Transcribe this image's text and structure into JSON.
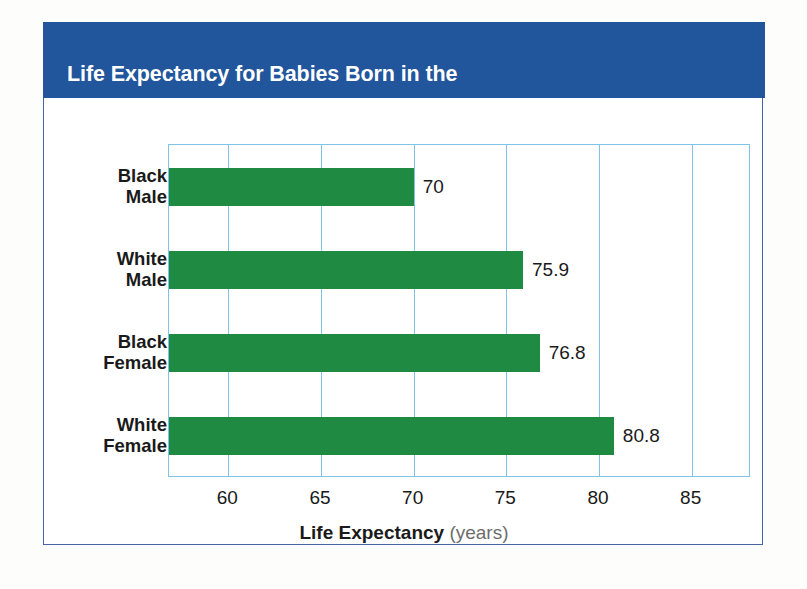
{
  "figure": {
    "title_line1": "Life Expectancy for Babies Born in the",
    "title_line2": "United States, 2007",
    "title_superscript": "32",
    "header_color": "#21559C",
    "bar_color": "#1F8A42",
    "grid_color": "#7FC4E8",
    "border_color": "#4A63A8"
  },
  "chart_data": {
    "type": "bar",
    "orientation": "horizontal",
    "title": "Life Expectancy for Babies Born in the United States, 2007",
    "categories": [
      "Black Male",
      "White Male",
      "Black Female",
      "White Female"
    ],
    "category_lines": [
      [
        "Black",
        "Male"
      ],
      [
        "White",
        "Male"
      ],
      [
        "Black",
        "Female"
      ],
      [
        "White",
        "Female"
      ]
    ],
    "values": [
      70,
      75.9,
      76.8,
      80.8
    ],
    "value_labels": [
      "70",
      "75.9",
      "76.8",
      "80.8"
    ],
    "xlabel": "Life Expectancy",
    "xlabel_units": "(years)",
    "ylabel": "",
    "xlim": [
      56.8,
      88.2
    ],
    "xticks": [
      60,
      65,
      70,
      75,
      80,
      85
    ],
    "xtick_labels": [
      "60",
      "65",
      "70",
      "75",
      "80",
      "85"
    ],
    "grid": true,
    "grid_axis": "x",
    "legend": null,
    "series": [
      {
        "name": "Life expectancy at birth",
        "values": [
          70,
          75.9,
          76.8,
          80.8
        ]
      }
    ]
  }
}
